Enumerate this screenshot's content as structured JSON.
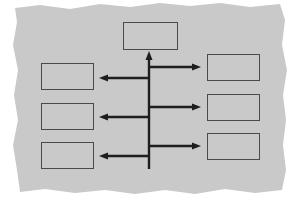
{
  "diagram": {
    "type": "hierarchy-branching",
    "background": {
      "color": "#c9c9c9",
      "style": "torn-paper"
    },
    "line_color": "#1e1e1e",
    "box_border_color": "#4a4a4a",
    "top_box": {
      "x": 123,
      "y": 22,
      "w": 55,
      "h": 28,
      "label": ""
    },
    "left_boxes": [
      {
        "x": 41,
        "y": 63,
        "w": 53,
        "h": 27,
        "label": ""
      },
      {
        "x": 41,
        "y": 103,
        "w": 53,
        "h": 27,
        "label": ""
      },
      {
        "x": 41,
        "y": 142,
        "w": 53,
        "h": 27,
        "label": ""
      }
    ],
    "right_boxes": [
      {
        "x": 207,
        "y": 54,
        "w": 53,
        "h": 27,
        "label": ""
      },
      {
        "x": 207,
        "y": 94,
        "w": 53,
        "h": 27,
        "label": ""
      },
      {
        "x": 207,
        "y": 133,
        "w": 53,
        "h": 27,
        "label": ""
      }
    ],
    "spine": {
      "x": 149,
      "y_top": 52,
      "y_bottom": 169
    },
    "left_arrows_y": [
      78,
      117,
      156
    ],
    "right_arrows_y": [
      67,
      107,
      146
    ]
  }
}
